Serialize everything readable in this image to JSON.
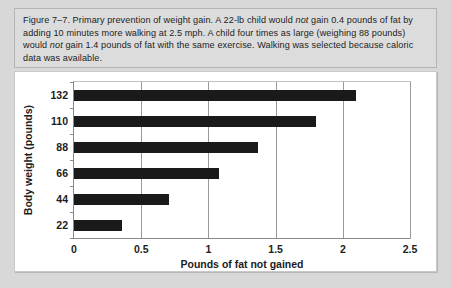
{
  "figure": {
    "caption_segments": [
      {
        "text": "Figure 7–7. Primary prevention of weight gain. A 22-lb child would ",
        "style": "normal"
      },
      {
        "text": "not",
        "style": "italic"
      },
      {
        "text": " gain 0.4 pounds of fat by adding 10 minutes more walking at 2.5 mph. A child four times as large (weighing 88 pounds) would ",
        "style": "normal"
      },
      {
        "text": "not",
        "style": "italic"
      },
      {
        "text": " gain 1.4 pounds of fat with the same exercise. Walking was selected because caloric data was available.",
        "style": "normal"
      }
    ],
    "caption_plain": "Figure 7–7. Primary prevention of weight gain. A 22-lb child would not gain 0.4 pounds of fat by adding 10 minutes more walking at 2.5 mph. A child four times as large (weighing 88 pounds) would not gain 1.4 pounds of fat with the same exercise. Walking was selected because caloric data was available.",
    "caption_label": "Figure 7–7.",
    "colors": {
      "page_background": "#d8d8d8",
      "caption_background": "#dcdcdc",
      "panel_background": "#ffffff",
      "bar_color": "#1a1a1a",
      "gridline_color": "#9a9a9a",
      "axis_color": "#8a8a8a",
      "text_color": "#1d1d1d"
    }
  },
  "chart_data": {
    "type": "bar",
    "orientation": "horizontal",
    "title": "",
    "xlabel": "Pounds of fat not gained",
    "ylabel": "Body weight (pounds)",
    "categories": [
      "22",
      "44",
      "66",
      "88",
      "110",
      "132"
    ],
    "values": [
      0.36,
      0.71,
      1.08,
      1.37,
      1.8,
      2.1
    ],
    "xlim": [
      0,
      2.5
    ],
    "xticks": [
      "0",
      "0.5",
      "1",
      "1.5",
      "2",
      "2.5"
    ],
    "xtick_values": [
      0,
      0.5,
      1,
      1.5,
      2,
      2.5
    ],
    "grid": "vertical",
    "legend": "none"
  }
}
